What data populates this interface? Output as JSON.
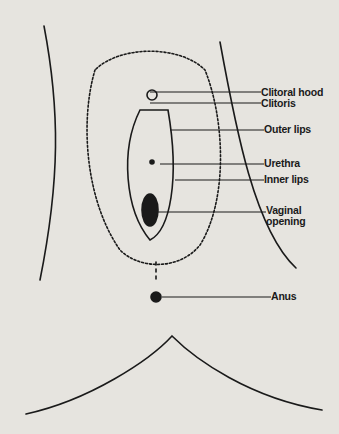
{
  "figure": {
    "type": "labeled anatomical line diagram (external genital anatomy, medical textbook style)",
    "stroke_color": "#1a1a1a",
    "background_color": "#e6e4df",
    "labels": [
      {
        "id": "clitoral-hood",
        "text": "Clitoral hood",
        "x": 261,
        "y": 87,
        "line_from_x": 150,
        "line_y": 92
      },
      {
        "id": "clitoris",
        "text": "Clitoris",
        "x": 261,
        "y": 98,
        "line_from_x": 150,
        "line_y": 103
      },
      {
        "id": "outer-lips",
        "text": "Outer lips",
        "x": 264,
        "y": 123,
        "line_from_x": 170,
        "line_y": 130
      },
      {
        "id": "urethra",
        "text": "Urethra",
        "x": 264,
        "y": 158,
        "line_from_x": 160,
        "line_y": 164
      },
      {
        "id": "inner-lips",
        "text": "Inner lips",
        "x": 264,
        "y": 174,
        "line_from_x": 175,
        "line_y": 180
      },
      {
        "id": "vaginal-opening",
        "text": "Vaginal\nopening",
        "x": 266,
        "y": 204,
        "line_from_x": 155,
        "line_y": 212
      },
      {
        "id": "anus",
        "text": "Anus",
        "x": 271,
        "y": 292,
        "line_from_x": 162,
        "line_y": 297
      }
    ]
  }
}
